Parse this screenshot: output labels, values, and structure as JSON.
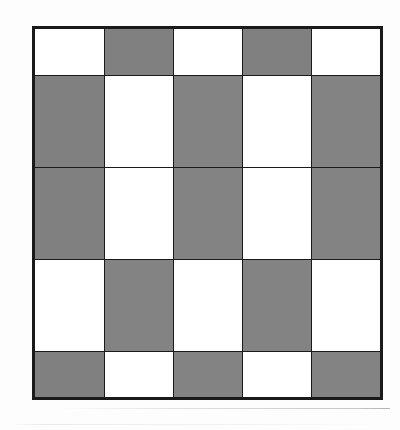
{
  "figure": {
    "rows": 5,
    "columns": 5,
    "border_color": "#1a1a1a",
    "shaded_color": "#a9a9a9",
    "blank_color": "#ffffff"
  },
  "chart_data": {
    "type": "heatmap",
    "title": "",
    "xlabel": "",
    "ylabel": "",
    "rows": 5,
    "columns": 5,
    "categories": [
      "c1",
      "c2",
      "c3",
      "c4",
      "c5"
    ],
    "row_labels": [
      "r1",
      "r2",
      "r3",
      "r4",
      "r5"
    ],
    "legend": [
      {
        "key": "shaded",
        "value": 1,
        "color": "#a9a9a9"
      },
      {
        "key": "blank",
        "value": 0,
        "color": "#ffffff"
      }
    ],
    "grid": true,
    "values": [
      [
        0,
        1,
        0,
        1,
        0
      ],
      [
        1,
        0,
        1,
        0,
        1
      ],
      [
        1,
        0,
        1,
        0,
        1
      ],
      [
        0,
        1,
        0,
        1,
        0
      ],
      [
        1,
        0,
        1,
        0,
        1
      ]
    ],
    "cells": [
      [
        "blank",
        "shaded",
        "blank",
        "shaded",
        "blank"
      ],
      [
        "shaded",
        "blank",
        "shaded",
        "blank",
        "shaded"
      ],
      [
        "shaded",
        "blank",
        "shaded",
        "blank",
        "shaded"
      ],
      [
        "blank",
        "shaded",
        "blank",
        "shaded",
        "blank"
      ],
      [
        "shaded",
        "blank",
        "shaded",
        "blank",
        "shaded"
      ]
    ]
  }
}
